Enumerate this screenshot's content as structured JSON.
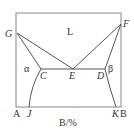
{
  "diagram": {
    "type": "binary eutectic phase diagram",
    "points": {
      "G": "G",
      "F": "F",
      "C": "C",
      "E": "E",
      "D": "D",
      "J": "J",
      "K": "K"
    },
    "regions": {
      "liquid": "L",
      "alpha": "α",
      "beta": "β"
    },
    "axis": {
      "left_component": "A",
      "right_component": "B",
      "xlabel": "B/%"
    }
  }
}
